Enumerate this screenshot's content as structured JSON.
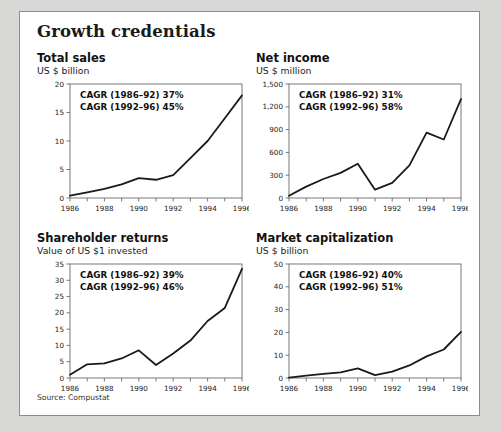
{
  "figure": {
    "title": "Growth credentials",
    "source_note": "Source: Compustat",
    "background_color": "#d8d8d6",
    "card_color": "#ffffff",
    "border_color": "#8c8c8c",
    "line_color": "#1a1a1a"
  },
  "panels": [
    {
      "key": "total-sales",
      "title": "Total sales",
      "subtitle": "US $ billion",
      "annotation_1": "CAGR (1986–92) 37%",
      "annotation_2": "CAGR (1992–96) 45%",
      "ytick_labels": [
        "0",
        "5",
        "10",
        "15",
        "20"
      ],
      "xtick_labels": [
        "1986",
        "1988",
        "1990",
        "1992",
        "1994",
        "1996"
      ]
    },
    {
      "key": "net-income",
      "title": "Net income",
      "subtitle": "US $ million",
      "annotation_1": "CAGR (1986–92) 31%",
      "annotation_2": "CAGR (1992–96) 58%",
      "ytick_labels": [
        "0",
        "300",
        "600",
        "900",
        "1,200",
        "1,500"
      ],
      "xtick_labels": [
        "1986",
        "1988",
        "1990",
        "1992",
        "1994",
        "1996"
      ]
    },
    {
      "key": "shareholder-returns",
      "title": "Shareholder returns",
      "subtitle": "Value of US $1 invested",
      "annotation_1": "CAGR (1986–92) 39%",
      "annotation_2": "CAGR (1992–96) 46%",
      "ytick_labels": [
        "0",
        "5",
        "10",
        "15",
        "20",
        "25",
        "30",
        "35"
      ],
      "xtick_labels": [
        "1986",
        "1988",
        "1990",
        "1992",
        "1994",
        "1996"
      ]
    },
    {
      "key": "market-capitalization",
      "title": "Market capitalization",
      "subtitle": "US $ billion",
      "annotation_1": "CAGR (1986–92) 40%",
      "annotation_2": "CAGR (1992–96) 51%",
      "ytick_labels": [
        "0",
        "10",
        "20",
        "30",
        "40",
        "50"
      ],
      "xtick_labels": [
        "1986",
        "1988",
        "1990",
        "1992",
        "1994",
        "1996"
      ]
    }
  ],
  "chart_data": [
    {
      "type": "line",
      "title": "Total sales",
      "subtitle": "US $ billion",
      "xlabel": "",
      "ylabel": "US $ billion",
      "x": [
        1986,
        1987,
        1988,
        1989,
        1990,
        1991,
        1992,
        1993,
        1994,
        1995,
        1996
      ],
      "values": [
        0.4,
        1.0,
        1.6,
        2.4,
        3.5,
        3.2,
        4.0,
        7.0,
        10.0,
        14.0,
        18.0
      ],
      "xlim": [
        1986,
        1996
      ],
      "ylim": [
        0,
        20
      ],
      "yticks": [
        0,
        5,
        10,
        15,
        20
      ],
      "xticks": [
        1986,
        1987,
        1988,
        1989,
        1990,
        1991,
        1992,
        1993,
        1994,
        1995,
        1996
      ],
      "xtick_labels_shown": [
        1986,
        1988,
        1990,
        1992,
        1994,
        1996
      ],
      "grid": false,
      "legend": "none",
      "annotations": [
        "CAGR (1986–92) 37%",
        "CAGR (1992–96) 45%"
      ]
    },
    {
      "type": "line",
      "title": "Net income",
      "subtitle": "US $ million",
      "xlabel": "",
      "ylabel": "US $ million",
      "x": [
        1986,
        1987,
        1988,
        1989,
        1990,
        1991,
        1992,
        1993,
        1994,
        1995,
        1996
      ],
      "values": [
        30,
        150,
        250,
        330,
        450,
        110,
        200,
        430,
        860,
        770,
        1300
      ],
      "xlim": [
        1986,
        1996
      ],
      "ylim": [
        0,
        1500
      ],
      "yticks": [
        0,
        300,
        600,
        900,
        1200,
        1500
      ],
      "xticks": [
        1986,
        1987,
        1988,
        1989,
        1990,
        1991,
        1992,
        1993,
        1994,
        1995,
        1996
      ],
      "xtick_labels_shown": [
        1986,
        1988,
        1990,
        1992,
        1994,
        1996
      ],
      "grid": false,
      "legend": "none",
      "annotations": [
        "CAGR (1986–92) 31%",
        "CAGR (1992–96) 58%"
      ]
    },
    {
      "type": "line",
      "title": "Shareholder returns",
      "subtitle": "Value of US $1 invested",
      "xlabel": "",
      "ylabel": "Value of US $1 invested",
      "x": [
        1986,
        1987,
        1988,
        1989,
        1990,
        1991,
        1992,
        1993,
        1994,
        1995,
        1996
      ],
      "values": [
        1.0,
        4.2,
        4.5,
        6.0,
        8.5,
        4.0,
        7.5,
        11.5,
        17.5,
        21.5,
        33.5
      ],
      "xlim": [
        1986,
        1996
      ],
      "ylim": [
        0,
        35
      ],
      "yticks": [
        0,
        5,
        10,
        15,
        20,
        25,
        30,
        35
      ],
      "xticks": [
        1986,
        1987,
        1988,
        1989,
        1990,
        1991,
        1992,
        1993,
        1994,
        1995,
        1996
      ],
      "xtick_labels_shown": [
        1986,
        1988,
        1990,
        1992,
        1994,
        1996
      ],
      "grid": false,
      "legend": "none",
      "annotations": [
        "CAGR (1986–92) 39%",
        "CAGR (1992–96) 46%"
      ]
    },
    {
      "type": "line",
      "title": "Market capitalization",
      "subtitle": "US $ billion",
      "xlabel": "",
      "ylabel": "US $ billion",
      "x": [
        1986,
        1987,
        1988,
        1989,
        1990,
        1991,
        1992,
        1993,
        1994,
        1995,
        1996
      ],
      "values": [
        0.2,
        1.0,
        1.8,
        2.5,
        4.2,
        1.3,
        2.8,
        5.5,
        9.5,
        12.5,
        20.2
      ],
      "xlim": [
        1986,
        1996
      ],
      "ylim": [
        0,
        50
      ],
      "yticks": [
        0,
        10,
        20,
        30,
        40,
        50
      ],
      "xticks": [
        1986,
        1987,
        1988,
        1989,
        1990,
        1991,
        1992,
        1993,
        1994,
        1995,
        1996
      ],
      "xtick_labels_shown": [
        1986,
        1988,
        1990,
        1992,
        1994,
        1996
      ],
      "grid": false,
      "legend": "none",
      "annotations": [
        "CAGR (1986–92) 40%",
        "CAGR (1992–96) 51%"
      ]
    }
  ]
}
